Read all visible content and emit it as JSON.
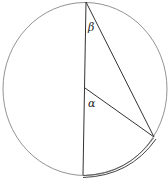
{
  "diagram": {
    "type": "inscribed-angle-circle",
    "labels": {
      "beta": "β",
      "alpha": "α"
    },
    "colors": {
      "stroke": "#555555",
      "line": "#333333",
      "background": "#ffffff"
    }
  }
}
